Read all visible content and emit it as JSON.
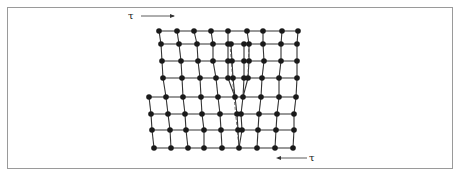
{
  "figure": {
    "stress_top": {
      "symbol": "τ",
      "direction": "right"
    },
    "stress_bottom": {
      "symbol": "τ",
      "direction": "left"
    },
    "colors": {
      "atom": "#1a1a1a",
      "bond": "#333333",
      "dashed": "#555555",
      "frame": "#9a9a9a"
    }
  },
  "lattice": {
    "rows": [
      {
        "y": 31,
        "atoms": [
          159,
          177,
          194,
          211,
          228,
          247,
          263,
          282,
          298
        ]
      },
      {
        "y": 44,
        "atoms": [
          161,
          179,
          197,
          213,
          228,
          231,
          244,
          249,
          263,
          281,
          297
        ]
      },
      {
        "y": 61,
        "atoms": [
          162,
          181,
          198,
          213,
          228,
          232,
          244,
          249,
          264,
          281,
          297
        ]
      },
      {
        "y": 78,
        "atoms": [
          163,
          182,
          200,
          216,
          228,
          233,
          244,
          248,
          262,
          279,
          297
        ]
      },
      {
        "y": 97,
        "atoms": [
          149,
          166,
          183,
          201,
          218,
          235,
          243,
          261,
          279,
          296
        ]
      },
      {
        "y": 114,
        "atoms": [
          151,
          168,
          185,
          202,
          220,
          237,
          241,
          259,
          277,
          294
        ]
      },
      {
        "y": 130,
        "atoms": [
          152,
          170,
          186,
          204,
          221,
          238,
          242,
          258,
          276,
          294
        ]
      },
      {
        "y": 148,
        "atoms": [
          154,
          171,
          188,
          204,
          222,
          239,
          257,
          275,
          293
        ]
      }
    ],
    "dashed_lines": [
      {
        "x1": 230,
        "y1": 44,
        "x2": 234,
        "y2": 97
      },
      {
        "x1": 234,
        "y1": 97,
        "x2": 239,
        "y2": 148
      },
      {
        "x1": 249,
        "y1": 44,
        "x2": 248,
        "y2": 78
      }
    ]
  }
}
